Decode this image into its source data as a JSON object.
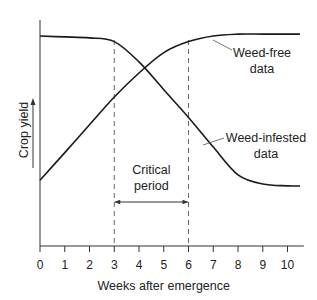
{
  "chart_data": {
    "type": "line",
    "title": "",
    "xlabel": "Weeks after emergence",
    "ylabel": "Crop yield",
    "xlim": [
      0,
      10.5
    ],
    "xticks": [
      0,
      1,
      2,
      3,
      4,
      5,
      6,
      7,
      8,
      9,
      10
    ],
    "xtick_labels": [
      "0",
      "1",
      "2",
      "3",
      "4",
      "5",
      "6",
      "7",
      "8",
      "9",
      "10"
    ],
    "yticks": [],
    "grid": false,
    "series": [
      {
        "name": "Weed-free data",
        "label_lines": [
          "Weed-free",
          "data"
        ],
        "x": [
          0,
          1,
          2,
          3,
          4,
          5,
          6,
          7,
          8,
          9,
          10,
          10.5
        ],
        "y": [
          0.22,
          0.37,
          0.52,
          0.67,
          0.8,
          0.91,
          0.97,
          1.0,
          1.01,
          1.01,
          1.01,
          1.01
        ]
      },
      {
        "name": "Weed-infested data",
        "label_lines": [
          "Weed-infested",
          "data"
        ],
        "x": [
          0,
          1,
          2,
          3,
          4,
          5,
          6,
          7,
          8,
          9,
          10,
          10.5
        ],
        "y": [
          1.0,
          0.995,
          0.99,
          0.97,
          0.86,
          0.71,
          0.56,
          0.4,
          0.25,
          0.2,
          0.19,
          0.19
        ]
      }
    ],
    "annotations": [
      {
        "type": "vline",
        "x": 3,
        "style": "dashed"
      },
      {
        "type": "vline",
        "x": 6,
        "style": "dashed"
      },
      {
        "type": "span-arrow",
        "x0": 3,
        "x1": 6,
        "label_lines": [
          "Critical",
          "period"
        ]
      }
    ]
  }
}
